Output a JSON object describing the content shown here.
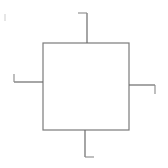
{
  "figure": {
    "title": "Four-terminal block symbol",
    "description": "Hand-drawn line diagram: an empty square block with four straight terminal leads leaving the top, bottom, left and right sides, each lead ending in a short perpendicular hook stub.",
    "canvas": {
      "width": 168,
      "height": 168,
      "background": "#ffffff"
    },
    "ink_color": "#7b7b7b",
    "ink_color_dark": "#6a6a6a",
    "stroke_width": 1.2,
    "body": {
      "shape": "square",
      "x": 43,
      "y": 43,
      "width": 86,
      "height": 87,
      "fill": "none"
    },
    "terminals": [
      {
        "name": "top-terminal",
        "side": "top",
        "lead": {
          "x1": 87,
          "y1": 13,
          "x2": 87,
          "y2": 43
        },
        "stub": {
          "x1": 78,
          "y1": 13,
          "x2": 87,
          "y2": 13
        },
        "stub_direction": "left"
      },
      {
        "name": "right-terminal",
        "side": "right",
        "lead": {
          "x1": 129,
          "y1": 85,
          "x2": 155,
          "y2": 85
        },
        "stub": {
          "x1": 155,
          "y1": 85,
          "x2": 155,
          "y2": 94
        },
        "stub_direction": "down"
      },
      {
        "name": "bottom-terminal",
        "side": "bottom",
        "lead": {
          "x1": 85,
          "y1": 130,
          "x2": 85,
          "y2": 157
        },
        "stub": {
          "x1": 85,
          "y1": 157,
          "x2": 94,
          "y2": 157
        },
        "stub_direction": "right"
      },
      {
        "name": "left-terminal",
        "side": "left",
        "lead": {
          "x1": 14,
          "y1": 82,
          "x2": 43,
          "y2": 82
        },
        "stub": {
          "x1": 14,
          "y1": 74,
          "x2": 14,
          "y2": 82
        },
        "stub_direction": "up"
      }
    ],
    "artifacts": [
      {
        "name": "scan-speck",
        "x": 4,
        "y": 14
      }
    ],
    "labels": []
  }
}
